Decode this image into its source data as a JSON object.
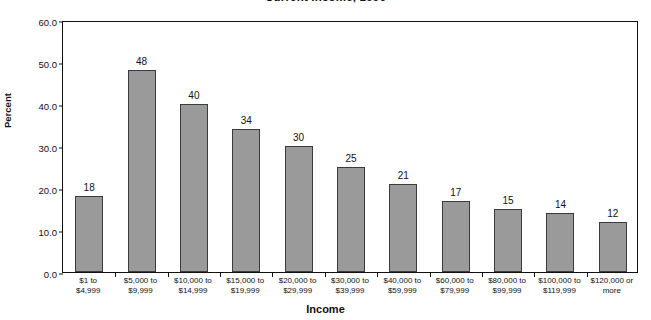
{
  "chart_data": {
    "type": "bar",
    "title": "Current Income, 1996",
    "xlabel": "Income",
    "ylabel": "Percent",
    "ylim": [
      0.0,
      60.0
    ],
    "ytick_labels": [
      "60.0",
      "50.0",
      "40.0",
      "30.0",
      "20.0",
      "10.0",
      "0.0"
    ],
    "ytick_values": [
      60.0,
      50.0,
      40.0,
      30.0,
      20.0,
      10.0,
      0.0
    ],
    "grid": false,
    "legend": "none",
    "bar_color": "#9a9a9a",
    "bar_edge_color": "#3b3b3b",
    "categories": [
      "$1 to\n$4,999",
      "$5,000 to\n$9,999",
      "$10,000 to\n$14,999",
      "$15,000 to\n$19,999",
      "$20,000 to\n$29,999",
      "$30,000 to\n$39,999",
      "$40,000 to\n$59,999",
      "$60,000 to\n$79,999",
      "$80,000 to\n$99,999",
      "$100,000 to\n$119,999",
      "$120,000 or\nmore"
    ],
    "category_lines": [
      [
        "$1 to",
        "$4,999"
      ],
      [
        "$5,000 to",
        "$9,999"
      ],
      [
        "$10,000 to",
        "$14,999"
      ],
      [
        "$15,000 to",
        "$19,999"
      ],
      [
        "$20,000 to",
        "$29,999"
      ],
      [
        "$30,000 to",
        "$39,999"
      ],
      [
        "$40,000 to",
        "$59,999"
      ],
      [
        "$60,000 to",
        "$79,999"
      ],
      [
        "$80,000 to",
        "$99,999"
      ],
      [
        "$100,000 to",
        "$119,999"
      ],
      [
        "$120,000 or",
        "more"
      ]
    ],
    "values": [
      18,
      48,
      40,
      34,
      30,
      25,
      21,
      17,
      15,
      14,
      12
    ],
    "data_labels": [
      "18",
      "48",
      "40",
      "34",
      "30",
      "25",
      "21",
      "17",
      "15",
      "14",
      "12"
    ]
  }
}
